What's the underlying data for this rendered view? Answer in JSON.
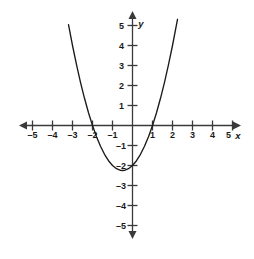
{
  "figure": {
    "name": "cartesian-parabola-plot",
    "background_color": "#ffffff",
    "axis_color": "#3a3a3a",
    "curve_color": "#1a1a1a",
    "label_color": "#1a1a1a",
    "width_px": 254,
    "height_px": 259
  },
  "chart_data": {
    "type": "line",
    "title": "",
    "subtitle": "",
    "xlabel": "x",
    "ylabel": "y",
    "xlim": [
      -5.5,
      5.5
    ],
    "ylim": [
      -5.5,
      5.5
    ],
    "grid": false,
    "legend": "none",
    "x_ticks": [
      -5,
      -4,
      -3,
      -2,
      -1,
      1,
      2,
      3,
      4,
      5
    ],
    "y_ticks": [
      -5,
      -4,
      -3,
      -2,
      -1,
      1,
      2,
      3,
      4,
      5
    ],
    "x_tick_labels": [
      "–5",
      "–4",
      "–3",
      "–2",
      "–1",
      "1",
      "2",
      "3",
      "4",
      "5"
    ],
    "y_tick_labels": [
      "–5",
      "–4",
      "–3",
      "–2",
      "–1",
      "1",
      "2",
      "3",
      "4",
      "5"
    ],
    "series": [
      {
        "name": "parabola",
        "equation": "y = x^2 + x - 2",
        "vertex": [
          -0.5,
          -2.25
        ],
        "x_intercepts": [
          -2,
          1
        ],
        "y_intercept": -2,
        "x": [
          -3.2,
          -3.0,
          -2.8,
          -2.6,
          -2.4,
          -2.2,
          -2.0,
          -1.8,
          -1.6,
          -1.4,
          -1.2,
          -1.0,
          -0.8,
          -0.6,
          -0.5,
          -0.4,
          -0.2,
          0.0,
          0.2,
          0.4,
          0.6,
          0.8,
          1.0,
          1.2,
          1.4,
          1.6,
          1.8,
          2.0,
          2.25
        ],
        "y": [
          5.04,
          4.0,
          3.04,
          2.16,
          1.36,
          0.64,
          0.0,
          -0.56,
          -1.04,
          -1.44,
          -1.76,
          -2.0,
          -2.16,
          -2.24,
          -2.25,
          -2.24,
          -2.16,
          -2.0,
          -1.76,
          -1.44,
          -1.04,
          -0.56,
          0.0,
          0.64,
          1.36,
          2.16,
          3.04,
          4.0,
          5.31
        ]
      }
    ]
  },
  "axis_labels": {
    "x_axis_name": "x",
    "y_axis_name": "y"
  }
}
